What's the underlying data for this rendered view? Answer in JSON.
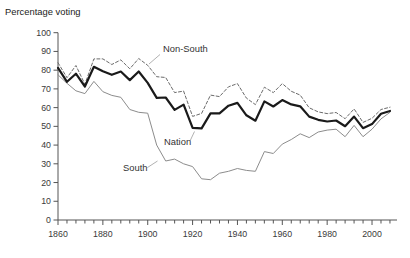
{
  "chart_data": {
    "type": "line",
    "title": "Percentage voting",
    "xlabel": "",
    "ylabel": "Percentage voting",
    "ylim": [
      0,
      100
    ],
    "xlim": [
      1860,
      2011
    ],
    "grid": false,
    "legend_position": "inline-labels",
    "yticks": [
      0,
      10,
      20,
      30,
      40,
      50,
      60,
      70,
      80,
      90,
      100
    ],
    "xticks_labeled": [
      1860,
      1880,
      1900,
      1920,
      1940,
      1960,
      1980,
      2000
    ],
    "minor_tick_interval_years": 4,
    "x": [
      1860,
      1864,
      1868,
      1872,
      1876,
      1880,
      1884,
      1888,
      1892,
      1896,
      1900,
      1904,
      1908,
      1912,
      1916,
      1920,
      1924,
      1928,
      1932,
      1936,
      1940,
      1944,
      1948,
      1952,
      1956,
      1960,
      1964,
      1968,
      1972,
      1976,
      1980,
      1984,
      1988,
      1992,
      1996,
      2000,
      2004,
      2008
    ],
    "series": [
      {
        "name": "Non-South",
        "style": "dashed",
        "color": "#6b6b6b",
        "width": 1,
        "values": [
          84.0,
          76.0,
          82.5,
          72.5,
          86.0,
          86.0,
          83.0,
          85.5,
          80.7,
          86.2,
          82.6,
          76.5,
          76.1,
          68.0,
          68.8,
          55.3,
          56.9,
          66.7,
          65.9,
          71.1,
          72.8,
          65.1,
          61.6,
          70.9,
          68.0,
          72.8,
          68.7,
          66.7,
          59.9,
          57.7,
          56.8,
          57.4,
          54.1,
          59.3,
          52.1,
          54.3,
          59.0,
          60.2
        ]
      },
      {
        "name": "Nation",
        "style": "solid-thick",
        "color": "#1a1a1a",
        "width": 2.2,
        "values": [
          81.2,
          73.8,
          78.1,
          71.3,
          81.8,
          79.4,
          77.5,
          79.3,
          74.7,
          79.3,
          73.2,
          65.2,
          65.4,
          58.8,
          61.6,
          49.2,
          48.9,
          56.9,
          56.9,
          61.0,
          62.5,
          55.9,
          53.0,
          63.3,
          60.6,
          64.0,
          61.7,
          60.7,
          55.2,
          53.5,
          52.6,
          53.1,
          50.1,
          55.2,
          49.0,
          51.2,
          56.7,
          58.2
        ]
      },
      {
        "name": "South",
        "style": "solid-thin",
        "color": "#8c8c8c",
        "width": 1,
        "values": [
          77.5,
          73.0,
          69.0,
          67.5,
          74.0,
          68.5,
          66.5,
          65.5,
          59.0,
          57.5,
          57.0,
          40.0,
          31.5,
          32.5,
          30.0,
          28.5,
          22.0,
          21.5,
          25.0,
          26.0,
          27.5,
          26.5,
          26.0,
          36.5,
          35.5,
          40.5,
          43.0,
          46.0,
          44.0,
          47.0,
          48.0,
          48.5,
          44.5,
          50.5,
          44.5,
          48.5,
          54.0,
          57.5
        ]
      }
    ],
    "annotations": [
      {
        "text": "Non-South",
        "series": "Non-South"
      },
      {
        "text": "Nation",
        "series": "Nation"
      },
      {
        "text": "South",
        "series": "South"
      }
    ],
    "colors": {
      "axis": "#555555",
      "tick_text": "#3a3a3a",
      "leader_line": "#a8a8a8",
      "background": "#ffffff"
    }
  }
}
